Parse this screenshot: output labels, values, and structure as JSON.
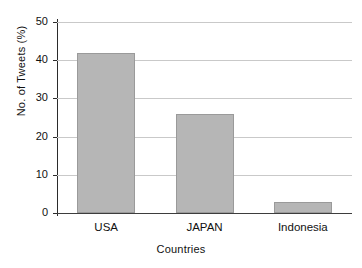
{
  "chart_data": {
    "type": "bar",
    "title": "",
    "xlabel": "Countries",
    "ylabel": "No. of Tweets (%)",
    "categories": [
      "USA",
      "JAPAN",
      "Indonesia"
    ],
    "values": [
      42,
      26,
      3
    ],
    "ylim": [
      0,
      50
    ],
    "yticks": [
      0,
      10,
      20,
      30,
      40,
      50
    ],
    "ytick_labels": [
      "0",
      "10",
      "20",
      "30",
      "40",
      "50"
    ],
    "grid": true,
    "legend": "none",
    "bar_color": "#b6b6b6",
    "bar_edge_color": "#9a9a9a",
    "grid_color": "#c9c9c9",
    "axis_color": "#2b2b2b",
    "background": "#ffffff"
  }
}
